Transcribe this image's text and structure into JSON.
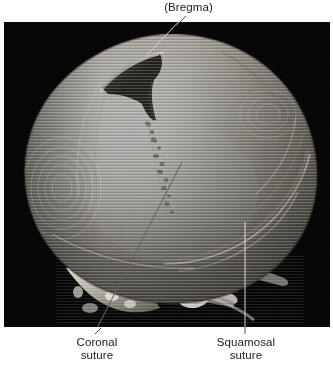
{
  "figure": {
    "type": "medical-illustration",
    "modality": "3D CT surface reconstruction",
    "background_color": "#ffffff",
    "image_panel": {
      "background_color": "#050505",
      "x": 4,
      "y": 22,
      "width": 326,
      "height": 305
    }
  },
  "labels": {
    "bregma": {
      "text": "(Bregma)",
      "position": "top-center",
      "leader": "diagonal-down-left"
    },
    "coronal": {
      "line1": "Coronal",
      "line2": "suture",
      "position": "bottom-left",
      "leader": "diagonal-up-right"
    },
    "squamosal": {
      "line1": "Squamosal",
      "line2": "suture",
      "position": "bottom-right",
      "leader": "vertical"
    }
  },
  "anatomy": {
    "structures": [
      "calvarium",
      "anterior fontanelle",
      "coronal suture",
      "squamosal suture",
      "temporal bone",
      "skull base",
      "external auditory meatus"
    ]
  },
  "colors": {
    "bone_highlight": "#f2f0ea",
    "bone_mid": "#c9c6bd",
    "bone_shadow": "#7d7a73",
    "fontanelle_dark": "#232323",
    "panel_black": "#050505",
    "label_text": "#1a1a1a",
    "leader_line": "#3a3a3a"
  }
}
